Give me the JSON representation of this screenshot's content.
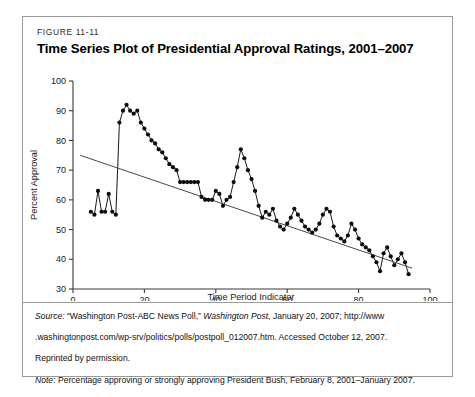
{
  "figure": {
    "number": "FIGURE 11-11",
    "title": "Time Series Plot of Presidential Approval Ratings, 2001–2007"
  },
  "caption": {
    "source_label": "Source:",
    "source_text_1": " “Washington Post-ABC News Poll,” ",
    "source_italic_1": "Washington Post",
    "source_text_2": ", January 20, 2007; http://www",
    "source_text_3": ".washingtonpost.com/wp-srv/politics/polls/postpoll_012007.htm. Accessed October 12, 2007.",
    "source_text_4": "Reprinted by permission.",
    "note_label": "Note",
    "note_text": ": Percentage approving or strongly approving President Bush, February 8, 2001–January 2007."
  },
  "chart_data": {
    "type": "line",
    "title": "Time Series Plot of Presidential Approval Ratings, 2001–2007",
    "xlabel": "Time Period Indicator",
    "ylabel": "Percent Approval",
    "xlim": [
      0,
      100
    ],
    "ylim": [
      30,
      100
    ],
    "xticks": [
      0,
      20,
      40,
      60,
      80,
      100
    ],
    "yticks": [
      30,
      40,
      50,
      60,
      70,
      80,
      90,
      100
    ],
    "grid": false,
    "legend": "none",
    "marker": "filled-circle",
    "series": [
      {
        "name": "Percent Approval",
        "x": [
          5,
          6,
          7,
          8,
          9,
          10,
          11,
          12,
          13,
          14,
          15,
          16,
          17,
          18,
          19,
          20,
          21,
          22,
          23,
          24,
          25,
          26,
          27,
          28,
          29,
          30,
          31,
          32,
          33,
          34,
          35,
          36,
          37,
          38,
          39,
          40,
          41,
          42,
          43,
          44,
          45,
          46,
          47,
          48,
          49,
          50,
          51,
          52,
          53,
          54,
          55,
          56,
          57,
          58,
          59,
          60,
          61,
          62,
          63,
          64,
          65,
          66,
          67,
          68,
          69,
          70,
          71,
          72,
          73,
          74,
          75,
          76,
          77,
          78,
          79,
          80,
          81,
          82,
          83,
          84,
          85,
          86,
          87,
          88,
          89,
          90,
          91,
          92,
          93,
          94
        ],
        "values": [
          56,
          55,
          63,
          56,
          56,
          62,
          56,
          55,
          86,
          90,
          92,
          90,
          89,
          90,
          86,
          84,
          82,
          80,
          79,
          77,
          76,
          74,
          72,
          71,
          70,
          66,
          66,
          66,
          66,
          66,
          66,
          61,
          60,
          60,
          60,
          63,
          62,
          58,
          60,
          61,
          66,
          71,
          77,
          74,
          70,
          67,
          63,
          58,
          54,
          56,
          55,
          57,
          53,
          51,
          50,
          52,
          54,
          57,
          55,
          53,
          51,
          50,
          49,
          50,
          52,
          55,
          57,
          56,
          51,
          48,
          47,
          46,
          48,
          52,
          50,
          47,
          45,
          44,
          43,
          41,
          39,
          36,
          42,
          44,
          41,
          38,
          40,
          42,
          39,
          35
        ]
      }
    ],
    "trendline": {
      "name": "linear-fit",
      "x_start": 2,
      "y_start": 75,
      "x_end": 95,
      "y_end": 37
    }
  }
}
